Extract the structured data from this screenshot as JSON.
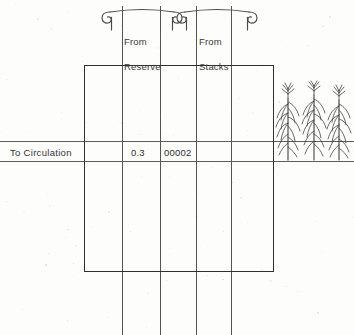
{
  "document": {
    "type": "scanned-ledger-diagram",
    "background_color": "#fdfdfc",
    "ink_color": "#2f2f2f"
  },
  "brackets": [
    {
      "id": "from-reserve",
      "label": "From\nReserve",
      "label_line1": "From",
      "label_line2": "Reserve",
      "x": 104,
      "y": 11,
      "width": 76,
      "style": "scroll-curl"
    },
    {
      "id": "from-stacks",
      "label": "From\nStacks",
      "label_line1": "From",
      "label_line2": "Stacks",
      "x": 179,
      "y": 11,
      "width": 76,
      "style": "scroll-curl"
    }
  ],
  "table": {
    "rect": {
      "x": 84,
      "y": 65,
      "width": 190,
      "height": 207
    },
    "column_rules_x": [
      122,
      160,
      196,
      231
    ],
    "rule_top_y": 6,
    "rule_bottom_y": 335,
    "rows": [
      {
        "label": "To  Circulation",
        "label_x": 10,
        "label_y": 148,
        "top_rule_y": 141,
        "bottom_rule_y": 161,
        "cells": [
          {
            "column": 2,
            "value": "0.3",
            "x": 131,
            "y": 148
          },
          {
            "column": 3,
            "value": "00002",
            "x": 164,
            "y": 148
          }
        ]
      }
    ]
  },
  "illustration": {
    "name": "corn-plants",
    "count": 3,
    "x": 276,
    "y": 82,
    "width": 74,
    "height": 78,
    "description": "three stylized corn stalks with tassels"
  },
  "colors": {
    "ink": "#2f2f2f",
    "rule": "#5c5c5a",
    "text": "#333333",
    "paper": "#fdfdfc"
  }
}
